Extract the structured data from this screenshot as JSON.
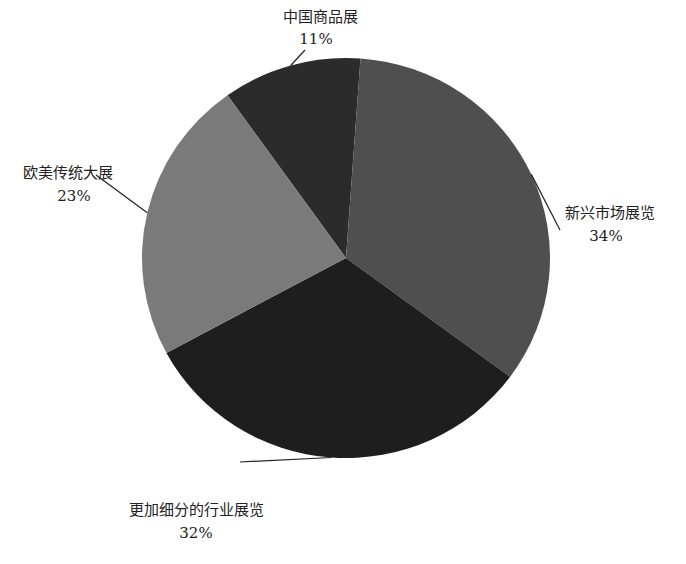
{
  "chart_data": {
    "type": "pie",
    "title": "",
    "slices": [
      {
        "label": "中国商品展",
        "value": 11,
        "display": "11%",
        "color": "#2b2b2b"
      },
      {
        "label": "新兴市场展览",
        "value": 34,
        "display": "34%",
        "color": "#4f4f4f"
      },
      {
        "label": "更加细分的行业展览",
        "value": 32,
        "display": "32%",
        "color": "#1e1e1e"
      },
      {
        "label": "欧美传统大展",
        "value": 23,
        "display": "23%",
        "color": "#7a7a7a"
      }
    ],
    "legend": "none",
    "data_labels": "outside-with-leader-lines"
  }
}
